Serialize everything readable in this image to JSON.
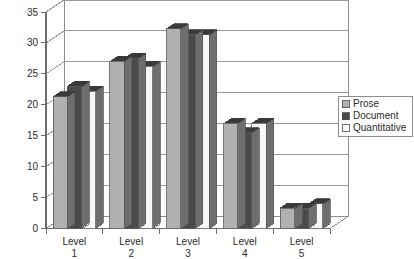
{
  "chart_data": {
    "type": "bar",
    "title": "",
    "subtitle": "",
    "xlabel": "",
    "ylabel": "",
    "categories": [
      "Level 1",
      "Level 2",
      "Level 3",
      "Level 4",
      "Level 5"
    ],
    "category_lines": [
      [
        "Level",
        "1"
      ],
      [
        "Level",
        "2"
      ],
      [
        "Level",
        "3"
      ],
      [
        "Level",
        "4"
      ],
      [
        "Level",
        "5"
      ]
    ],
    "series": [
      {
        "name": "Prose",
        "values": [
          21.3,
          27.0,
          32.3,
          17.0,
          3.3
        ],
        "color": "#b0b0b0"
      },
      {
        "name": "Document",
        "values": [
          23.0,
          27.5,
          31.3,
          15.5,
          3.3
        ],
        "color": "#4a4a4a"
      },
      {
        "name": "Quantitative",
        "values": [
          22.2,
          26.2,
          31.3,
          17.0,
          4.0
        ],
        "color": "#f7f7f7"
      }
    ],
    "ylim": [
      0,
      35
    ],
    "ytick_values": [
      0,
      5,
      10,
      15,
      20,
      25,
      30,
      35
    ],
    "ytick_labels": [
      "0",
      "5",
      "10",
      "15",
      "20",
      "25",
      "30",
      "35"
    ],
    "grid": true,
    "grid_axis": "y",
    "legend": {
      "position": "right",
      "entries": [
        {
          "label": "Prose",
          "swatch": "#b0b0b0"
        },
        {
          "label": "Document",
          "swatch": "#4a4a4a"
        },
        {
          "label": "Quantitative",
          "swatch": "#fbfbfb"
        }
      ]
    },
    "projection": "3d",
    "colors": {
      "plot_background": "#ffffff",
      "frame": "#8d8d8d",
      "gridline": "#9a9a9a",
      "axis": "#6d6d6d",
      "bar_top": "#3a3a3a",
      "bar_side": "#6e6e6e",
      "text": "#2b2b2b"
    }
  }
}
